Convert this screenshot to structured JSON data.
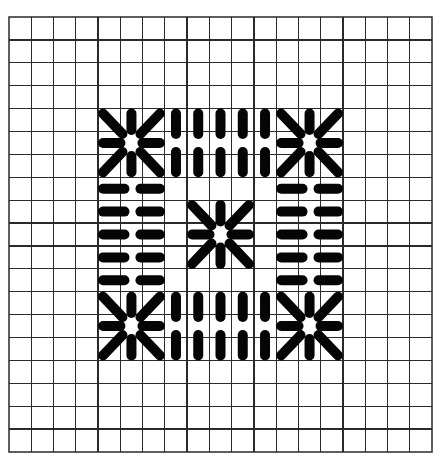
{
  "diagram": {
    "type": "needlepoint-stitch-chart",
    "background": "#ffffff",
    "grid": {
      "cols": 19,
      "rows": 19,
      "x0": 9,
      "y0": 17,
      "width": 423,
      "height": 435,
      "line_color": "#2a2a2a"
    },
    "stitch_color": "#050505",
    "stitch_width": 10,
    "stitch_gap": 11,
    "diag_gap": 9,
    "stars": [
      {
        "name": "star-top-left",
        "col": 5,
        "row": 5
      },
      {
        "name": "star-top-right",
        "col": 13,
        "row": 5
      },
      {
        "name": "star-center",
        "col": 9,
        "row": 9
      },
      {
        "name": "star-bottom-left",
        "col": 5,
        "row": 13
      },
      {
        "name": "star-bottom-right",
        "col": 13,
        "row": 13
      }
    ],
    "vertical_bands": [
      {
        "name": "vertical-band-top",
        "cols": [
          7,
          8,
          9,
          10,
          11
        ],
        "center_row": 5
      },
      {
        "name": "vertical-band-bottom",
        "cols": [
          7,
          8,
          9,
          10,
          11
        ],
        "center_row": 13
      }
    ],
    "horizontal_bands": [
      {
        "name": "horizontal-band-left",
        "rows": [
          7,
          8,
          9,
          10,
          11
        ],
        "center_col": 5
      },
      {
        "name": "horizontal-band-right",
        "rows": [
          7,
          8,
          9,
          10,
          11
        ],
        "center_col": 13
      }
    ]
  }
}
